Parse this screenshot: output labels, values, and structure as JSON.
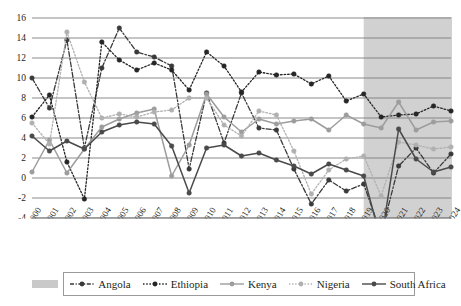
{
  "chart_data": {
    "type": "line",
    "title": "",
    "xlabel": "",
    "ylabel": "",
    "grid": true,
    "legend_position": "bottom",
    "ylim": [
      -4,
      16
    ],
    "ytick_step": 2,
    "yticks": [
      "16",
      "14",
      "12",
      "10",
      "8",
      "6",
      "4",
      "2",
      "0",
      "-2",
      "-4"
    ],
    "categories": [
      "2000",
      "2001",
      "2002",
      "2003",
      "2004",
      "2005",
      "2006",
      "2007",
      "2008",
      "2009",
      "2010",
      "2011",
      "2012",
      "2013",
      "2014",
      "2015",
      "2016",
      "2017",
      "2018",
      "2019",
      "2020",
      "2021",
      "2022",
      "2023",
      "2024"
    ],
    "shaded_region": {
      "label": "forecast",
      "from": "2019",
      "to": "2024",
      "color": "#c9c9c9"
    },
    "series": [
      {
        "name": "Angola",
        "color": "#3a3a3a",
        "style": "dash-dot",
        "marker": "circle",
        "values": [
          10.0,
          7.0,
          13.8,
          3.0,
          11.0,
          15.0,
          12.6,
          12.1,
          11.2,
          0.9,
          8.5,
          3.5,
          8.5,
          5.0,
          4.8,
          0.9,
          -2.6,
          -0.2,
          -1.3,
          -0.6,
          -5.6,
          1.2,
          3.0,
          0.5,
          2.4
        ]
      },
      {
        "name": "Ethiopia",
        "color": "#262626",
        "style": "dotted",
        "marker": "circle",
        "values": [
          6.1,
          8.3,
          1.6,
          -2.1,
          13.6,
          11.8,
          10.8,
          11.5,
          10.8,
          8.8,
          12.6,
          11.2,
          8.6,
          10.6,
          10.3,
          10.4,
          9.4,
          10.2,
          7.7,
          8.4,
          6.1,
          6.3,
          6.4,
          7.2,
          6.7
        ]
      },
      {
        "name": "Kenya",
        "color": "#9d9d9d",
        "style": "solid",
        "marker": "circle",
        "values": [
          0.6,
          3.8,
          0.5,
          2.9,
          5.1,
          5.9,
          6.5,
          6.9,
          0.2,
          3.3,
          8.4,
          6.1,
          4.6,
          5.9,
          5.4,
          5.7,
          5.9,
          4.8,
          6.3,
          5.4,
          5.0,
          7.6,
          4.8,
          5.6,
          5.7
        ]
      },
      {
        "name": "Nigeria",
        "color": "#b0b0b0",
        "style": "dotted",
        "marker": "circle",
        "values": [
          5.5,
          3.4,
          14.6,
          9.6,
          6.0,
          6.4,
          6.1,
          6.6,
          6.8,
          8.0,
          8.0,
          5.3,
          4.2,
          6.7,
          6.3,
          2.7,
          -1.6,
          0.8,
          1.9,
          2.2,
          -1.8,
          3.6,
          3.3,
          2.9,
          3.1
        ]
      },
      {
        "name": "South Africa",
        "color": "#4a4a4a",
        "style": "solid",
        "marker": "circle",
        "values": [
          4.2,
          2.7,
          3.7,
          2.9,
          4.6,
          5.3,
          5.6,
          5.4,
          3.2,
          -1.5,
          3.0,
          3.3,
          2.2,
          2.5,
          1.8,
          1.2,
          0.4,
          1.4,
          0.8,
          0.2,
          -6.3,
          4.9,
          1.9,
          0.6,
          1.1
        ]
      }
    ]
  },
  "legend": {
    "entries": [
      {
        "label": "Angola",
        "key": "dash-dot"
      },
      {
        "label": "Ethiopia",
        "key": "dotted"
      },
      {
        "label": "Kenya",
        "key": "solid"
      },
      {
        "label": "Nigeria",
        "key": "dotted-light"
      },
      {
        "label": "South Africa",
        "key": "solid-dark"
      }
    ],
    "shade_swatch_name": "forecast-shade-swatch"
  }
}
